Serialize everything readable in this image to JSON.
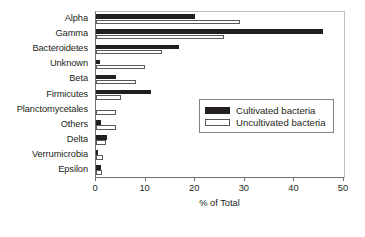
{
  "chart_data": {
    "type": "bar",
    "orientation": "horizontal",
    "title": "",
    "xlabel": "% of Total",
    "ylabel": "",
    "xlim": [
      0,
      50
    ],
    "xticks": [
      0,
      10,
      20,
      30,
      40,
      50
    ],
    "xticklabels": [
      "0",
      "10",
      "20",
      "30",
      "40",
      "50"
    ],
    "grid": false,
    "legend_position": "center-right",
    "categories": [
      "Alpha",
      "Gamma",
      "Bacteroidetes",
      "Unknown",
      "Beta",
      "Firmicutes",
      "Planctomycetales",
      "Others",
      "Delta",
      "Verrumicrobia",
      "Epsilon"
    ],
    "series": [
      {
        "name": "Cultivated bacteria",
        "style": "filled",
        "color": "#231f20",
        "values": [
          20.0,
          45.8,
          16.7,
          0.9,
          4.0,
          11.0,
          0.0,
          1.0,
          2.3,
          0.1,
          1.0
        ]
      },
      {
        "name": "Uncultivated bacteria",
        "style": "hollow",
        "color": "#ffffff",
        "values": [
          29.0,
          25.8,
          13.3,
          9.9,
          8.0,
          5.0,
          4.0,
          4.0,
          2.0,
          1.5,
          1.3
        ]
      }
    ]
  }
}
